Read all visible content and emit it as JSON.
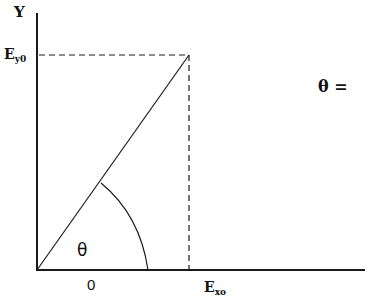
{
  "diagram": {
    "axes": {
      "y_label": "Y",
      "x_origin_label": "0"
    },
    "labels": {
      "ey0_main": "E",
      "ey0_sub": "y0",
      "ex0_main": "E",
      "ex0_sub": "xo",
      "theta_inside": "θ",
      "theta_equation": "θ ="
    },
    "colors": {
      "line": "#1a1a1a",
      "background": "#ffffff"
    },
    "geometry": {
      "origin": [
        37,
        270
      ],
      "y_axis_top": [
        37,
        13
      ],
      "x_axis_end": [
        365,
        270
      ],
      "vector_end": [
        189,
        55
      ],
      "arc_start": [
        101,
        183
      ],
      "arc_end": [
        148,
        270
      ]
    }
  }
}
